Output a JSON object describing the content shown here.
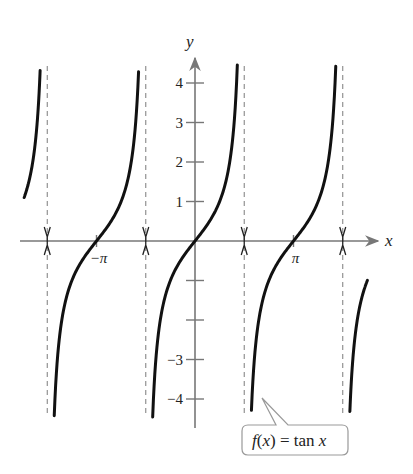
{
  "chart_data": {
    "type": "line",
    "title": "",
    "function_label": "f(x) = tan x",
    "callout": {
      "italic_f": "f",
      "paren_open": "(",
      "var": "x",
      "paren_close": ")",
      "eq": " = tan ",
      "var2": "x"
    },
    "xlabel": "x",
    "ylabel": "y",
    "xlim": [
      -5.6,
      6.05
    ],
    "ylim": [
      -4.35,
      4.4
    ],
    "x_ticks": [
      {
        "value": -3.14159,
        "label": "−π"
      },
      {
        "value": 3.14159,
        "label": "π"
      }
    ],
    "y_ticks": [
      {
        "value": 1,
        "label": "1"
      },
      {
        "value": 2,
        "label": "2"
      },
      {
        "value": 3,
        "label": "3"
      },
      {
        "value": 4,
        "label": "4"
      },
      {
        "value": -1,
        "label": ""
      },
      {
        "value": -2,
        "label": ""
      },
      {
        "value": -3,
        "label": "−3"
      },
      {
        "value": -4,
        "label": "−4"
      }
    ],
    "asymptotes": [
      -4.71239,
      -1.5708,
      1.5708,
      4.71239
    ],
    "asymptote_style": "dashed",
    "series": [
      {
        "name": "tan x branch 1",
        "x_range": [
          -5.45,
          -4.94
        ],
        "note": "partial branch left of x=-3π/2"
      },
      {
        "name": "tan x branch 2",
        "x_range": [
          -4.49,
          -1.8
        ]
      },
      {
        "name": "tan x branch 3",
        "x_range": [
          -1.35,
          1.35
        ]
      },
      {
        "name": "tan x branch 4",
        "x_range": [
          1.8,
          4.49
        ]
      },
      {
        "name": "tan x branch 5",
        "x_range": [
          4.94,
          5.5
        ],
        "note": "partial branch right of x=3π/2"
      }
    ],
    "sample_points": [
      {
        "x": -3.14159,
        "y": 0
      },
      {
        "x": 0,
        "y": 0
      },
      {
        "x": 3.14159,
        "y": 0
      },
      {
        "x": 0.7854,
        "y": 1
      },
      {
        "x": -0.7854,
        "y": -1
      }
    ],
    "grid": false,
    "legend": "none"
  }
}
